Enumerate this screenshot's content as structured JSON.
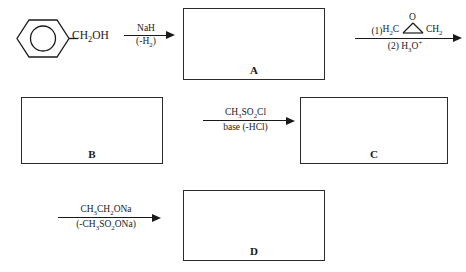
{
  "scheme": {
    "title": "Multi-step synthesis scheme with unknown products A, B, C, D",
    "starting_material": {
      "name": "benzyl-alcohol",
      "ring_icon": "benzene-ring-aromatic-circle",
      "chain_prefix": "CH",
      "chain_sub": "2",
      "chain_suffix": "OH"
    },
    "boxes": [
      {
        "id": "A",
        "label": "A",
        "content": ""
      },
      {
        "id": "B",
        "label": "B",
        "content": ""
      },
      {
        "id": "C",
        "label": "C",
        "content": ""
      },
      {
        "id": "D",
        "label": "D",
        "content": ""
      }
    ],
    "arrows": [
      {
        "id": "step-1",
        "above": "NaH",
        "below": "(-H2)",
        "below_parts": {
          "pre": "(-H",
          "sub": "2",
          "post": ")"
        }
      },
      {
        "id": "step-2",
        "above_parts": {
          "a": "CH",
          "a_sub": "3",
          "b": "SO",
          "b_sub": "2",
          "c": "Cl"
        },
        "above": "CH3SO2Cl",
        "below": "base (-HCl)"
      },
      {
        "id": "step-3",
        "above_parts": {
          "a": "CH",
          "a_sub": "3",
          "b": "CH",
          "b_sub": "2",
          "c": "ONa"
        },
        "above": "CH3CH2ONa",
        "below_parts": {
          "a": "(-CH",
          "a_sub": "3",
          "b": "SO",
          "b_sub": "2",
          "c": "ONa)"
        },
        "below": "(-CH3SO2ONa)"
      },
      {
        "id": "step-4",
        "step_one_number": "(1)",
        "epoxide": {
          "name": "ethylene-oxide",
          "apex_atom": "O",
          "left_label_pre": "H",
          "left_label_sub": "2",
          "left_label_post": "C",
          "right_label_pre": "CH",
          "right_label_sub": "2"
        },
        "step_two_number": "(2)",
        "below_parts": {
          "pre": "H",
          "sub": "3",
          "post": "O",
          "charge": "+"
        },
        "below": "(2) H3O+"
      }
    ]
  }
}
